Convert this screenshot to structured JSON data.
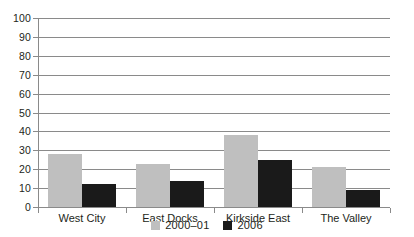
{
  "chart_data": {
    "type": "bar",
    "title": "",
    "xlabel": "",
    "ylabel": "",
    "ylim": [
      0,
      100
    ],
    "yticks": [
      0,
      10,
      20,
      30,
      40,
      50,
      60,
      70,
      80,
      90,
      100
    ],
    "grid": true,
    "legend_position": "bottom-center",
    "categories": [
      "West City",
      "East Docks",
      "Kirkside East",
      "The Valley"
    ],
    "series": [
      {
        "name": "2000–01",
        "color": "#bfbfbf",
        "values": [
          28,
          23,
          38,
          21
        ]
      },
      {
        "name": "2006",
        "color": "#1a1a1a",
        "values": [
          12,
          14,
          25,
          9
        ]
      }
    ]
  },
  "axis": {
    "tick_labels": [
      "100",
      "90",
      "80",
      "70",
      "60",
      "50",
      "40",
      "30",
      "20",
      "10",
      "0"
    ]
  },
  "legend": {
    "items": [
      {
        "label": "2000–01",
        "swatch": "series-a"
      },
      {
        "label": "2006",
        "swatch": "series-b"
      }
    ]
  },
  "colors": {
    "series_a": "#bfbfbf",
    "series_b": "#1a1a1a",
    "grid": "#8a8a8a",
    "text": "#231f20",
    "background": "#ffffff"
  }
}
